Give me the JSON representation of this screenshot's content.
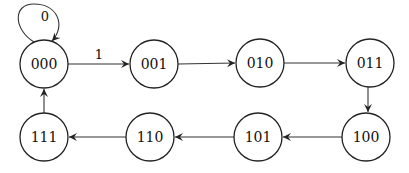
{
  "diagram": {
    "type": "state-transition",
    "states": [
      {
        "id": "s000",
        "label": "000",
        "x": 44,
        "y": 64
      },
      {
        "id": "s001",
        "label": "001",
        "x": 154,
        "y": 64
      },
      {
        "id": "s010",
        "label": "010",
        "x": 260,
        "y": 63
      },
      {
        "id": "s011",
        "label": "011",
        "x": 370,
        "y": 63
      },
      {
        "id": "s100",
        "label": "100",
        "x": 366,
        "y": 136
      },
      {
        "id": "s101",
        "label": "101",
        "x": 258,
        "y": 137
      },
      {
        "id": "s110",
        "label": "110",
        "x": 150,
        "y": 137
      },
      {
        "id": "s111",
        "label": "111",
        "x": 44,
        "y": 137
      }
    ],
    "transitions": [
      {
        "from": "000",
        "to": "000",
        "label": "0"
      },
      {
        "from": "000",
        "to": "001",
        "label": "1"
      },
      {
        "from": "001",
        "to": "010",
        "label": ""
      },
      {
        "from": "010",
        "to": "011",
        "label": ""
      },
      {
        "from": "011",
        "to": "100",
        "label": ""
      },
      {
        "from": "100",
        "to": "101",
        "label": ""
      },
      {
        "from": "101",
        "to": "110",
        "label": ""
      },
      {
        "from": "110",
        "to": "111",
        "label": ""
      },
      {
        "from": "111",
        "to": "000",
        "label": ""
      }
    ],
    "self_loop_label": "0",
    "edge_000_001_label": "1",
    "colors": {
      "stroke": "#222222",
      "background": "#ffffff"
    }
  }
}
